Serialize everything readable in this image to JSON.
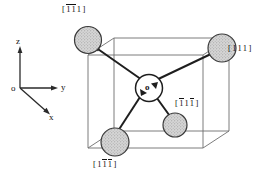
{
  "figure": {
    "type": "crystal-direction-tetrahedron",
    "axes": {
      "origin_label": "o",
      "x_label": "x",
      "y_label": "y",
      "z_label": "z"
    },
    "center_atom": {
      "label": "o"
    },
    "bond_labels": [
      {
        "name": "top-left-direction",
        "text": "[ 1̅1̅1 ]",
        "digits": [
          {
            "d": "1",
            "bar": true
          },
          {
            "d": "1",
            "bar": true
          },
          {
            "d": "1",
            "bar": false
          }
        ]
      },
      {
        "name": "right-direction",
        "text": "[ 111 ]",
        "digits": [
          {
            "d": "1",
            "bar": false
          },
          {
            "d": "1",
            "bar": false
          },
          {
            "d": "1",
            "bar": false
          }
        ]
      },
      {
        "name": "inner-right-direction",
        "text": "[ 1̅11̅ ]",
        "digits": [
          {
            "d": "1",
            "bar": true
          },
          {
            "d": "1",
            "bar": false
          },
          {
            "d": "1",
            "bar": true
          }
        ]
      },
      {
        "name": "bottom-direction",
        "text": "[ 11̅1̅ ]",
        "digits": [
          {
            "d": "1",
            "bar": false
          },
          {
            "d": "1",
            "bar": true
          },
          {
            "d": "1",
            "bar": true
          }
        ]
      }
    ],
    "colors": {
      "line": "#2a2a2a",
      "cube_edge": "#6e6e6e",
      "sphere_fill": "#d3d3d3",
      "sphere_stroke": "#3a3a3a",
      "center_fill": "#ffffff",
      "text": "#111111"
    }
  }
}
